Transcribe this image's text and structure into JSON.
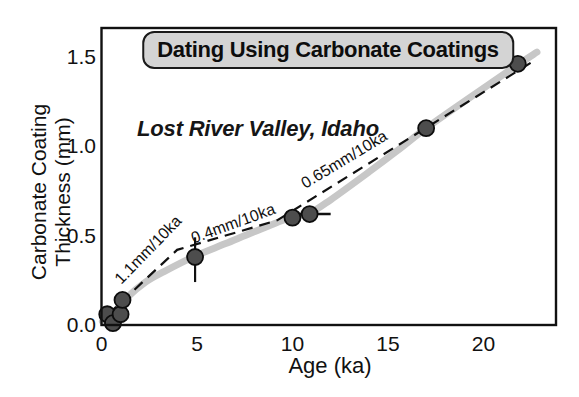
{
  "chart_data": {
    "type": "scatter",
    "title": "Dating Using Carbonate Coatings",
    "subtitle": "Lost River Valley, Idaho",
    "xlabel": "Age (ka)",
    "ylabel": "Carbonate Coating Thickness (mm)",
    "ylabel_lines": [
      "Carbonate Coating",
      "Thickness (mm)"
    ],
    "xlim": [
      0,
      23.8
    ],
    "ylim": [
      0,
      1.66
    ],
    "grid": false,
    "legend": "none",
    "x_ticks": [
      {
        "value": 0,
        "label": "0"
      },
      {
        "value": 5,
        "label": "5"
      },
      {
        "value": 10,
        "label": "10"
      },
      {
        "value": 15,
        "label": "15"
      },
      {
        "value": 20,
        "label": "20"
      }
    ],
    "y_ticks": [
      {
        "value": 0,
        "label": "0.0"
      },
      {
        "value": 0.5,
        "label": "0.5"
      },
      {
        "value": 1.0,
        "label": "1.0"
      },
      {
        "value": 1.5,
        "label": "1.5"
      }
    ],
    "points": [
      {
        "x": 0.3,
        "y": 0.06
      },
      {
        "x": 0.6,
        "y": 0.01
      },
      {
        "x": 1.0,
        "y": 0.06
      },
      {
        "x": 1.1,
        "y": 0.14
      },
      {
        "x": 4.9,
        "y": 0.38
      },
      {
        "x": 10.0,
        "y": 0.6
      },
      {
        "x": 10.9,
        "y": 0.62
      },
      {
        "x": 17.0,
        "y": 1.1
      },
      {
        "x": 21.8,
        "y": 1.46
      }
    ],
    "error_bars": [
      {
        "orient": "vertical",
        "x": 4.9,
        "from": 0.24,
        "to": 0.49
      },
      {
        "orient": "horizontal",
        "y": 0.62,
        "from": 10.2,
        "to": 12.0
      }
    ],
    "trend_band": [
      [
        0.05,
        0.02
      ],
      [
        0.7,
        0.07
      ],
      [
        1.3,
        0.15
      ],
      [
        2.3,
        0.24
      ],
      [
        3.3,
        0.3
      ],
      [
        4.9,
        0.385
      ],
      [
        6.5,
        0.455
      ],
      [
        8.2,
        0.53
      ],
      [
        10.0,
        0.605
      ],
      [
        10.9,
        0.625
      ],
      [
        12.0,
        0.7
      ],
      [
        14.0,
        0.855
      ],
      [
        15.5,
        0.975
      ],
      [
        17.0,
        1.1
      ],
      [
        19.0,
        1.25
      ],
      [
        20.5,
        1.36
      ],
      [
        21.8,
        1.455
      ],
      [
        22.8,
        1.525
      ]
    ],
    "fit_line_dashed": [
      [
        0.35,
        0.06
      ],
      [
        3.96,
        0.42
      ],
      [
        9.2,
        0.585
      ],
      [
        22.7,
        1.48
      ]
    ],
    "rate_labels": [
      {
        "text": "1.1mm/10ka",
        "x": 2.64,
        "y": 0.4,
        "angle": -46
      },
      {
        "text": "0.4mm/10ka",
        "x": 6.99,
        "y": 0.54,
        "angle": -20
      },
      {
        "text": "0.65mm/10ka",
        "x": 12.85,
        "y": 0.9,
        "angle": -31
      }
    ],
    "colors": {
      "band": "#c7c7c7",
      "point_fill": "#4d4d4d",
      "point_stroke": "#0d0d0d",
      "line": "#111111",
      "title_box_fill": "#d4d4d4",
      "text": "#111111"
    }
  }
}
